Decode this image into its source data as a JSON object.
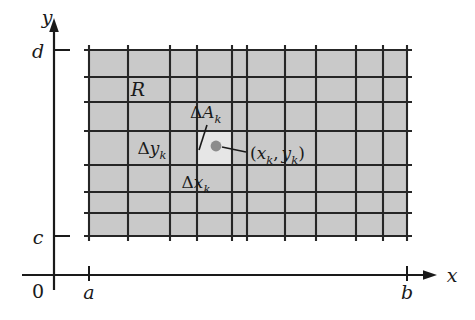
{
  "figure": {
    "background_color": "#ffffff"
  },
  "axes": {
    "x_axis_name": "x",
    "y_axis_name": "y",
    "origin_label": "0",
    "x_ticks": [
      {
        "label": "a",
        "value": "a"
      },
      {
        "label": "b",
        "value": "b"
      }
    ],
    "y_ticks": [
      {
        "label": "c",
        "value": "c"
      },
      {
        "label": "d",
        "value": "d"
      }
    ]
  },
  "region": {
    "label": "R",
    "fill_color": "#c9c9c9",
    "grid_line_color": "#262626",
    "columns": 11,
    "rows": 7
  },
  "annotations": {
    "area_element": {
      "delta": "Δ",
      "base": "A",
      "subscript": "k",
      "full": "ΔAₖ"
    },
    "delta_y": {
      "delta": "Δ",
      "base": "y",
      "subscript": "k",
      "full": "Δyₖ"
    },
    "delta_x": {
      "delta": "Δ",
      "base": "x",
      "subscript": "k",
      "full": "Δxₖ"
    },
    "sample_point": {
      "open_paren": "(",
      "x_base": "x",
      "x_sub": "k",
      "comma": ",",
      "y_base": "y",
      "y_sub": "k",
      "close_paren": ")",
      "full": "(xₖ, yₖ)",
      "dot_color": "#8c8c8c"
    },
    "highlighted_cell_color": "#e4e4e4"
  }
}
